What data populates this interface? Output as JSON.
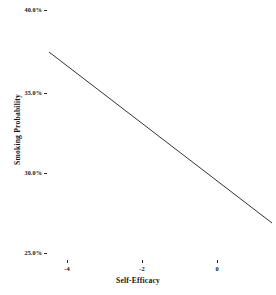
{
  "chart_data": {
    "type": "line",
    "title": "",
    "subtitle": "",
    "xlabel": "Self-Efficacy",
    "ylabel": "Smoking Probability",
    "x": [
      -4.48,
      1.47
    ],
    "values": [
      37.4,
      26.9
    ],
    "series": [
      {
        "name": "predicted smoking probability",
        "x": [
          -4.48,
          1.47
        ],
        "values": [
          37.4,
          26.9
        ]
      }
    ],
    "xlim": [
      -4.48,
      1.47
    ],
    "ylim": [
      25.0,
      40.0
    ],
    "x_ticks": [
      -4,
      -2,
      0
    ],
    "x_tick_labels": [
      "-4",
      "-2",
      "0"
    ],
    "y_ticks": [
      25.0,
      30.0,
      35.0,
      40.0
    ],
    "y_tick_labels": [
      "25.0%",
      "30.0%",
      "35.0%",
      "40.0%"
    ],
    "grid": false,
    "legend": false,
    "legend_position": "none",
    "annotations": [],
    "slope_per_unit_percent": -1.77,
    "line_color": "#333333",
    "background_color": "#ffffff"
  },
  "axes": {
    "y": {
      "title": "Smoking Probability",
      "ticks": [
        {
          "label": "40.0%",
          "value": 40.0,
          "y_px": 10
        },
        {
          "label": "35.0%",
          "value": 35.0,
          "y_px": 93
        },
        {
          "label": "30.0%",
          "value": 30.0,
          "y_px": 173
        },
        {
          "label": "25.0%",
          "value": 25.0,
          "y_px": 253
        }
      ]
    },
    "x": {
      "title": "Self-Efficacy",
      "ticks": [
        {
          "label": "-4",
          "value": -4,
          "x_px": 67
        },
        {
          "label": "-2",
          "value": -2,
          "x_px": 142
        },
        {
          "label": "0",
          "value": 0,
          "x_px": 217
        }
      ]
    }
  },
  "line": {
    "start_px": {
      "x": 49,
      "y": 52
    },
    "end_px": {
      "x": 272,
      "y": 223
    },
    "color": "#333333",
    "width_px": 1
  },
  "colors": {
    "background": "#ffffff",
    "ink": "#141414",
    "line": "#333333",
    "tick": "#2b2b2b"
  }
}
